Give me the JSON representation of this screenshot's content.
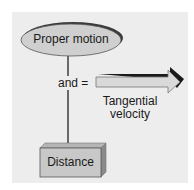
{
  "diagram": {
    "nodes": {
      "proper_motion": {
        "label": "Proper motion",
        "shape": "ellipse",
        "fill": "#cfcfcf"
      },
      "distance": {
        "label": "Distance",
        "shape": "box-3d",
        "fill": "#c8c8c8"
      },
      "tangential_velocity": {
        "label_line1": "Tangential",
        "label_line2": "velocity",
        "shape": "arrow",
        "fill": "#d9d9d9"
      }
    },
    "operator": {
      "label": "and ="
    },
    "colors": {
      "panel": "#ededed",
      "stroke": "#222222",
      "shadow": "#1a1a1a"
    }
  }
}
